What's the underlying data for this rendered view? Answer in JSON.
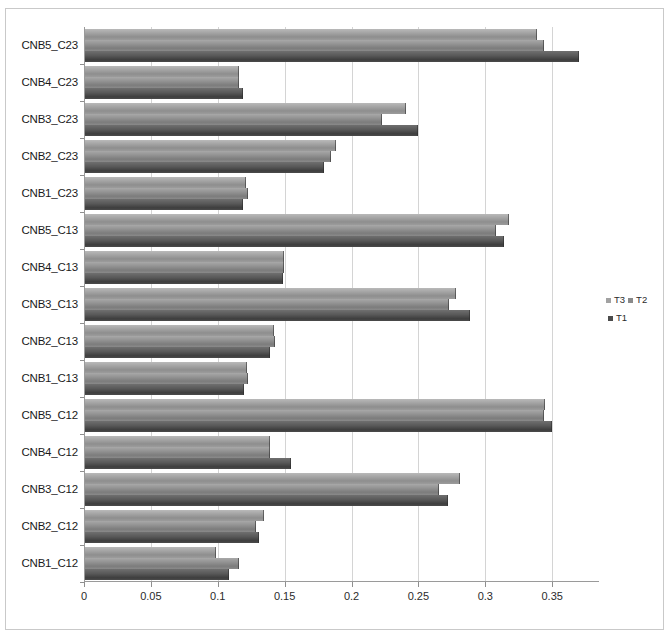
{
  "chart_data": {
    "type": "bar",
    "orientation": "horizontal",
    "title": "",
    "subtitle": "",
    "xlabel": "",
    "ylabel": "",
    "grid": true,
    "legend_position": "right",
    "xlim": [
      0,
      0.385
    ],
    "xticks": [
      "0",
      "0.05",
      "0.1",
      "0.15",
      "0.2",
      "0.25",
      "0.3",
      "0.35"
    ],
    "xtick_values": [
      0,
      0.05,
      0.1,
      0.15,
      0.2,
      0.25,
      0.3,
      0.35
    ],
    "categories": [
      "CNB5_C23",
      "CNB4_C23",
      "CNB3_C23",
      "CNB2_C23",
      "CNB1_C23",
      "CNB5_C13",
      "CNB4_C13",
      "CNB3_C13",
      "CNB2_C13",
      "CNB1_C13",
      "CNB5_C12",
      "CNB4_C12",
      "CNB3_C12",
      "CNB2_C12",
      "CNB1_C12"
    ],
    "series": [
      {
        "name": "T3",
        "color": "#a2a2a2",
        "values": [
          0.338,
          0.115,
          0.24,
          0.188,
          0.12,
          0.317,
          0.149,
          0.277,
          0.141,
          0.121,
          0.344,
          0.138,
          0.28,
          0.134,
          0.098
        ]
      },
      {
        "name": "T2",
        "color": "#8a8a8a",
        "values": [
          0.343,
          0.115,
          0.222,
          0.184,
          0.122,
          0.307,
          0.149,
          0.272,
          0.142,
          0.122,
          0.343,
          0.138,
          0.265,
          0.128,
          0.115
        ]
      },
      {
        "name": "T1",
        "color": "#4b4b4b",
        "values": [
          0.369,
          0.118,
          0.249,
          0.179,
          0.118,
          0.313,
          0.148,
          0.288,
          0.138,
          0.119,
          0.349,
          0.154,
          0.271,
          0.13,
          0.108
        ]
      }
    ]
  },
  "legend": {
    "entries": [
      {
        "label": "T3",
        "color": "#a2a2a2"
      },
      {
        "label": "T2",
        "color": "#8a8a8a"
      },
      {
        "label": "T1",
        "color": "#4b4b4b"
      }
    ]
  }
}
